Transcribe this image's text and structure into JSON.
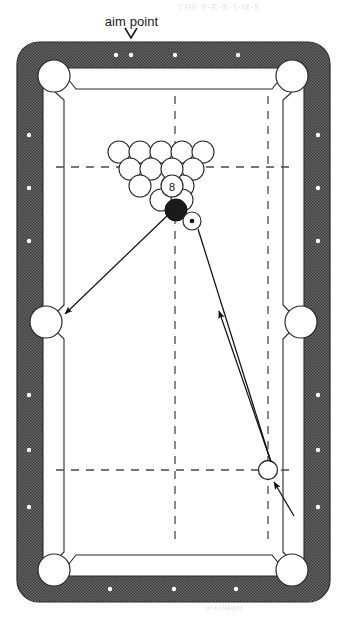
{
  "figure": {
    "type": "pool-table-diagram",
    "annotation_label": "aim point",
    "annotation_marker": "v",
    "colors": {
      "rail": "#5c5c5c",
      "rail_pattern": "#3d3d3d",
      "cloth": "#ffffff",
      "line": "#1a1a1a",
      "ball_fill": "#ffffff",
      "eight_ball_fill": "#1a1a1a",
      "ghost_bleed": "#e9e9ea"
    }
  },
  "table": {
    "outer": {
      "x": 17,
      "y": 42,
      "width": 313,
      "height": 560,
      "corner_radius": 22
    },
    "rail_thickness": 26,
    "playfield": {
      "x": 43,
      "y": 68,
      "width": 261,
      "height": 508
    },
    "pockets": [
      {
        "name": "top-left-pocket",
        "cx": 54,
        "cy": 76,
        "r": 16
      },
      {
        "name": "top-right-pocket",
        "cx": 292,
        "cy": 76,
        "r": 16
      },
      {
        "name": "left-side-pocket",
        "cx": 45,
        "cy": 322,
        "r": 16
      },
      {
        "name": "right-side-pocket",
        "cx": 301,
        "cy": 322,
        "r": 16
      },
      {
        "name": "bottom-left-pocket",
        "cx": 54,
        "cy": 570,
        "r": 16
      },
      {
        "name": "bottom-right-pocket",
        "cx": 292,
        "cy": 570,
        "r": 16
      }
    ],
    "diamonds": {
      "top": [
        {
          "x": 116,
          "y": 55
        },
        {
          "x": 131,
          "y": 55
        },
        {
          "x": 175,
          "y": 55
        },
        {
          "x": 238,
          "y": 55
        }
      ],
      "bottom": [
        {
          "x": 110,
          "y": 589
        },
        {
          "x": 174,
          "y": 589
        },
        {
          "x": 236,
          "y": 589
        }
      ],
      "left": [
        {
          "x": 29,
          "y": 135
        },
        {
          "x": 29,
          "y": 188
        },
        {
          "x": 29,
          "y": 241
        },
        {
          "x": 29,
          "y": 395
        },
        {
          "x": 29,
          "y": 450
        },
        {
          "x": 29,
          "y": 507
        }
      ],
      "right": [
        {
          "x": 318,
          "y": 135
        },
        {
          "x": 318,
          "y": 188
        },
        {
          "x": 318,
          "y": 241
        },
        {
          "x": 318,
          "y": 395
        },
        {
          "x": 318,
          "y": 450
        },
        {
          "x": 318,
          "y": 507
        }
      ]
    },
    "dashed_lines": [
      {
        "name": "head-string",
        "orientation": "horizontal",
        "x1": 56,
        "y1": 167,
        "x2": 292,
        "y2": 167
      },
      {
        "name": "foot-string",
        "orientation": "horizontal",
        "x1": 56,
        "y1": 470,
        "x2": 292,
        "y2": 470
      },
      {
        "name": "center-long-string",
        "orientation": "vertical",
        "x1": 175,
        "y1": 96,
        "x2": 175,
        "y2": 545
      },
      {
        "name": "right-quarter-string",
        "orientation": "vertical",
        "x1": 268,
        "y1": 96,
        "x2": 268,
        "y2": 545
      }
    ]
  },
  "balls": {
    "rack": {
      "name": "ball-rack",
      "ball_radius": 11,
      "rows": [
        {
          "count": 5,
          "y": 152,
          "x_start": 119,
          "spacing": 21
        },
        {
          "count": 4,
          "y": 167,
          "x_start": 130,
          "spacing": 21
        },
        {
          "count": 3,
          "y": 183,
          "x_start": 140,
          "spacing": 21
        },
        {
          "count": 2,
          "y": 199,
          "x_start": 151,
          "spacing": 21
        },
        {
          "count": 1,
          "y": 210,
          "x_start": 176,
          "spacing": 21
        }
      ],
      "eight_ball": {
        "label": "8",
        "cx": 172,
        "cy": 180,
        "r": 11,
        "style": "outlined-white"
      },
      "apex_ball": {
        "label": "",
        "cx": 176,
        "cy": 208,
        "r": 11,
        "style": "solid-black"
      }
    },
    "object_ball": {
      "name": "object-ball",
      "cx": 191,
      "cy": 220,
      "r": 9,
      "style": "white-with-center-dot"
    },
    "cue_ball": {
      "name": "cue-ball",
      "cx": 268,
      "cy": 470,
      "r": 9,
      "style": "white-outline"
    }
  },
  "arrows": [
    {
      "name": "cue-path-arrow",
      "from": {
        "x": 272,
        "y": 463
      },
      "to": {
        "x": 194,
        "y": 227
      },
      "arrowhead_at": {
        "x": 219,
        "y": 317
      },
      "description": "cue ball travel line toward object ball"
    },
    {
      "name": "object-ball-path-arrow",
      "from": {
        "x": 172,
        "y": 212
      },
      "to": {
        "x": 60,
        "y": 316
      },
      "arrowhead_at": {
        "x": 60,
        "y": 316
      },
      "description": "object ball path into left side pocket"
    },
    {
      "name": "cue-ball-pointer-arrow",
      "from": {
        "x": 292,
        "y": 513
      },
      "to": {
        "x": 272,
        "y": 480
      },
      "arrowhead_at": {
        "x": 272,
        "y": 480
      },
      "description": "pointer indicating the cue ball"
    },
    {
      "name": "aim-point-pointer",
      "from": {
        "x": 131,
        "y": 28
      },
      "to": {
        "x": 131,
        "y": 42
      },
      "description": "v marker pointing at aim point diamond on top rail"
    }
  ],
  "bleed_text": [
    {
      "text": "THE P-E-R-I-M-E",
      "x": 178,
      "y": 10,
      "size": 9
    },
    {
      "text": "for the shot and",
      "x": 52,
      "y": 118,
      "size": 8
    },
    {
      "text": "o tiny  bit  o",
      "x": 208,
      "y": 118,
      "size": 8
    },
    {
      "text": "practice  mak",
      "x": 228,
      "y": 142,
      "size": 8
    },
    {
      "text": "the  rail  and",
      "x": 42,
      "y": 210,
      "size": 8
    },
    {
      "text": "it  will  help",
      "x": 210,
      "y": 212,
      "size": 8
    },
    {
      "text": "ball  is  the",
      "x": 214,
      "y": 238,
      "size": 8
    },
    {
      "text": "you  must",
      "x": 40,
      "y": 250,
      "size": 8
    },
    {
      "text": "to  the  edge",
      "x": 206,
      "y": 394,
      "size": 8
    },
    {
      "text": "cut  angle",
      "x": 216,
      "y": 418,
      "size": 8
    },
    {
      "text": "be  a  bit",
      "x": 214,
      "y": 440,
      "size": 8
    },
    {
      "text": "the  cue  ball  will",
      "x": 40,
      "y": 470,
      "size": 8
    },
    {
      "text": "a  left  of  center",
      "x": 38,
      "y": 494,
      "size": 8
    },
    {
      "text": "english  to  make",
      "x": 36,
      "y": 518,
      "size": 8
    },
    {
      "text": "the  shot  work",
      "x": 40,
      "y": 542,
      "size": 8
    },
    {
      "text": "spin  on  the  cue",
      "x": 208,
      "y": 542,
      "size": 8
    },
    {
      "text": "ball  makes  it",
      "x": 214,
      "y": 566,
      "size": 8
    },
    {
      "text": "come  off  the  rail",
      "x": 198,
      "y": 590,
      "size": 8
    },
    {
      "text": "at  a  sharper",
      "x": 206,
      "y": 610,
      "size": 8
    }
  ]
}
